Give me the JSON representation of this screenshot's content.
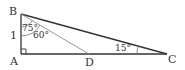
{
  "diagram": {
    "type": "geometry-triangle",
    "vertices": {
      "A": "A",
      "B": "B",
      "C": "C",
      "D": "D"
    },
    "side_labels": {
      "AB": "1"
    },
    "angle_labels": {
      "ABC": "75°",
      "ABD": "60°",
      "ACB": "15°"
    },
    "right_angle_at": "A",
    "colors": {
      "main_line": "#333333",
      "cevian_line": "#999999"
    }
  }
}
